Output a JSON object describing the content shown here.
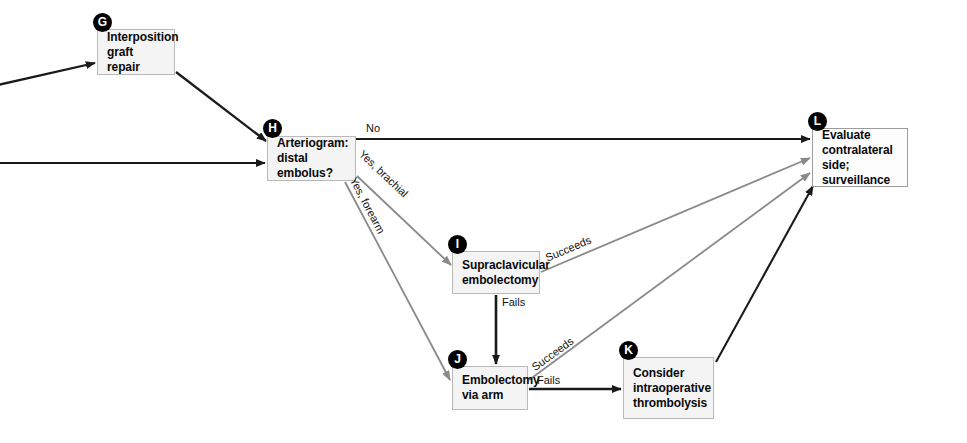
{
  "diagram": {
    "type": "clinical-algorithm-flowchart",
    "canvas": {
      "width": 967,
      "height": 443
    },
    "colors": {
      "black_edge": "#1a1a1a",
      "gray_edge": "#8a8a8a",
      "node_fill": "#f4f4f4",
      "node_border": "#b9b9b9",
      "badge_fill": "#000000",
      "badge_text": "#ffffff",
      "text": "#0a0a0a",
      "background": "#ffffff"
    },
    "nodes": [
      {
        "key": "G",
        "badge": "G",
        "label": "Interposition\ngraft repair",
        "x": 97,
        "y": 29,
        "w": 78,
        "h": 46,
        "fill": "gray"
      },
      {
        "key": "H",
        "badge": "H",
        "label": "Arteriogram:\ndistal embolus?",
        "x": 267,
        "y": 136,
        "w": 89,
        "h": 45,
        "fill": "gray"
      },
      {
        "key": "I",
        "badge": "I",
        "label": "Supraclavicular\nembolectomy",
        "x": 452,
        "y": 251,
        "w": 88,
        "h": 43,
        "fill": "gray"
      },
      {
        "key": "J",
        "badge": "J",
        "label": "Embolectomy\nvia arm",
        "x": 452,
        "y": 366,
        "w": 76,
        "h": 44,
        "fill": "gray"
      },
      {
        "key": "K",
        "badge": "K",
        "label": "Consider\nintraoperative\nthrombolysis",
        "x": 623,
        "y": 357,
        "w": 91,
        "h": 62,
        "fill": "gray"
      },
      {
        "key": "L",
        "badge": "L",
        "label": "Evaluate\ncontralateral\nside; surveillance",
        "x": 812,
        "y": 128,
        "w": 96,
        "h": 59,
        "fill": "white"
      }
    ],
    "edges": [
      {
        "id": "in-to-G",
        "from": "left-edge",
        "to": "G",
        "color": "black",
        "label": ""
      },
      {
        "id": "in-to-H",
        "from": "left-edge",
        "to": "H",
        "color": "black",
        "label": ""
      },
      {
        "id": "G-to-H",
        "from": "G",
        "to": "H",
        "color": "black",
        "label": ""
      },
      {
        "id": "H-to-L",
        "from": "H",
        "to": "L",
        "color": "black",
        "label": "No"
      },
      {
        "id": "H-to-I",
        "from": "H",
        "to": "I",
        "color": "gray",
        "label": "Yes, brachial"
      },
      {
        "id": "H-to-J",
        "from": "H",
        "to": "J",
        "color": "gray",
        "label": "Yes, forearm"
      },
      {
        "id": "I-to-L",
        "from": "I",
        "to": "L",
        "color": "gray",
        "label": "Succeeds"
      },
      {
        "id": "I-to-J",
        "from": "I",
        "to": "J",
        "color": "black",
        "label": "Fails"
      },
      {
        "id": "J-to-L",
        "from": "J",
        "to": "L",
        "color": "gray",
        "label": "Succeeds"
      },
      {
        "id": "J-to-K",
        "from": "J",
        "to": "K",
        "color": "black",
        "label": "Fails"
      },
      {
        "id": "K-to-L",
        "from": "K",
        "to": "L",
        "color": "black",
        "label": ""
      }
    ],
    "edge_labels": {
      "no": "No",
      "yes_brachial": "Yes, brachial",
      "yes_forearm": "Yes, forearm",
      "succeeds_i": "Succeeds",
      "fails_i": "Fails",
      "succeeds_j": "Succeeds",
      "fails_j": "Fails"
    }
  }
}
